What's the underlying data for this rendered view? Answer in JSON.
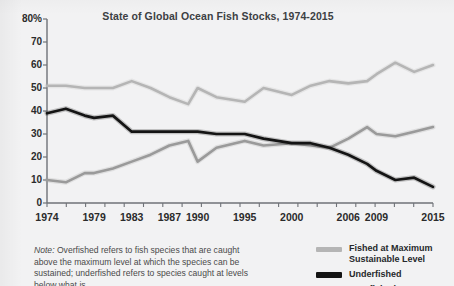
{
  "chart_data": {
    "type": "line",
    "title": "State of Global Ocean Fish Stocks, 1974-2015",
    "xlabel": "",
    "ylabel": "",
    "ylim": [
      0,
      80
    ],
    "yticks": [
      0,
      10,
      20,
      30,
      40,
      50,
      60,
      70,
      80
    ],
    "ytick_labels": [
      "0",
      "10",
      "20",
      "30",
      "40",
      "50",
      "60",
      "70",
      "80%"
    ],
    "xlim": [
      1974,
      2015
    ],
    "xtick_labels": [
      "1974",
      "1979",
      "1983",
      "1987",
      "1990",
      "1995",
      "2000",
      "2006",
      "2009",
      "2015"
    ],
    "xtick_values": [
      1974,
      1979,
      1983,
      1987,
      1990,
      1995,
      2000,
      2006,
      2009,
      2015
    ],
    "grid": false,
    "legend_position": "bottom-right",
    "x": [
      1974,
      1976,
      1978,
      1979,
      1981,
      1983,
      1985,
      1987,
      1989,
      1990,
      1992,
      1995,
      1997,
      2000,
      2002,
      2004,
      2006,
      2008,
      2009,
      2011,
      2013,
      2015
    ],
    "series": [
      {
        "name": "Fished at Maximum Sustainable Level",
        "color": "#b5b5b5",
        "values": [
          51,
          51,
          50,
          50,
          50,
          53,
          50,
          46,
          43,
          50,
          46,
          44,
          50,
          47,
          51,
          53,
          52,
          53,
          56,
          61,
          57,
          60
        ]
      },
      {
        "name": "Underfished",
        "color": "#141414",
        "values": [
          39,
          41,
          38,
          37,
          38,
          31,
          31,
          31,
          31,
          31,
          30,
          30,
          28,
          26,
          26,
          24,
          21,
          17,
          14,
          10,
          11,
          7
        ]
      },
      {
        "name": "Overfished",
        "color": "#9a9a9a",
        "values": [
          10,
          9,
          13,
          13,
          15,
          18,
          21,
          25,
          27,
          18,
          24,
          27,
          25,
          26,
          25,
          24,
          28,
          33,
          30,
          29,
          31,
          33
        ]
      }
    ],
    "legend": [
      {
        "label_line1": "Fished at Maximum",
        "label_line2": "Sustainable Level",
        "color": "#b5b5b5",
        "weight": "normal"
      },
      {
        "label_line1": "Underfished",
        "label_line2": "",
        "color": "#141414",
        "weight": "thick"
      },
      {
        "label_line1": "Overfished",
        "label_line2": "",
        "color": "#9a9a9a",
        "weight": "normal"
      }
    ]
  },
  "note": {
    "prefix": "Note:",
    "body": " Overfished refers to fish species that are caught above the maximum level at which the species can be sustained; underfished refers to species caught at levels below what is"
  },
  "colors": {
    "background": "#f2f2f3",
    "axis": "#6f7277",
    "text": "#2b2b2b",
    "title": "#3c4043"
  }
}
